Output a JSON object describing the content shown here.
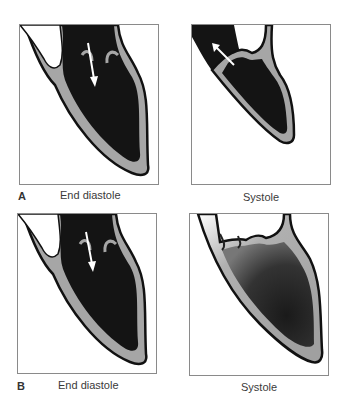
{
  "figure": {
    "row_a": {
      "letter": "A",
      "left_caption": "End diastole",
      "right_caption": "Systole"
    },
    "row_b": {
      "letter": "B",
      "left_caption": "End diastole",
      "right_caption": "Systole"
    }
  },
  "colors": {
    "blood": "#141414",
    "wall": "#a6a6a6",
    "outline": "#111111",
    "frame": "#8a8a8a",
    "arrow": "#ffffff"
  }
}
